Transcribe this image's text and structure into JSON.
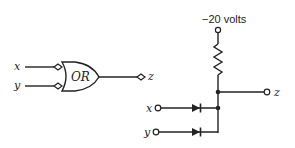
{
  "logic_symbol": {
    "inputs": [
      {
        "label": "x"
      },
      {
        "label": "y"
      }
    ],
    "gate": {
      "type": "OR",
      "label": "OR"
    },
    "output": {
      "label": "z"
    }
  },
  "diode_circuit": {
    "supply": {
      "label": "−20 volts"
    },
    "inputs": [
      {
        "label": "x"
      },
      {
        "label": "y"
      }
    ],
    "output": {
      "label": "z"
    },
    "components": [
      "resistor",
      "diode-x",
      "diode-y"
    ]
  },
  "colors": {
    "ink": "#222222",
    "background": "#ffffff"
  }
}
